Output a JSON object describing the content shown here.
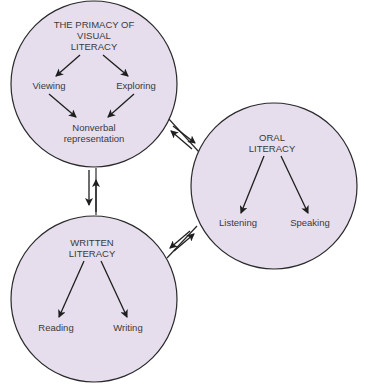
{
  "colors": {
    "circle_fill": "#e6deec",
    "stroke": "#2a2a2a",
    "text": "#3a3a3a",
    "background": "#ffffff"
  },
  "circles": {
    "visual": {
      "title_lines": [
        "THE PRIMACY OF",
        "VISUAL",
        "LITERACY"
      ],
      "nodes": [
        "Viewing",
        "Exploring"
      ],
      "result_lines": [
        "Nonverbal",
        "representation"
      ]
    },
    "oral": {
      "title_lines": [
        "ORAL",
        "LITERACY"
      ],
      "nodes": [
        "Listening",
        "Speaking"
      ]
    },
    "written": {
      "title_lines": [
        "WRITTEN",
        "LITERACY"
      ],
      "nodes": [
        "Reading",
        "Writing"
      ]
    }
  },
  "connections": [
    {
      "from": "visual",
      "to": "oral",
      "type": "bidirectional"
    },
    {
      "from": "visual",
      "to": "written",
      "type": "bidirectional"
    },
    {
      "from": "written",
      "to": "oral",
      "type": "bidirectional"
    }
  ]
}
